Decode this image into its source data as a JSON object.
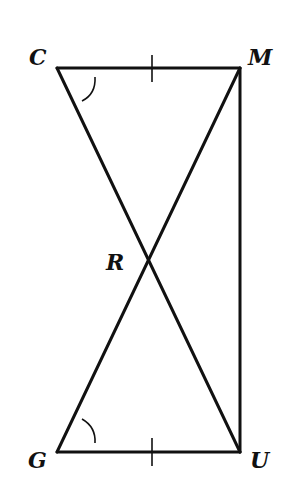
{
  "diagram": {
    "type": "geometry",
    "stroke_color": "#111111",
    "background": "#ffffff",
    "points": {
      "C": {
        "label": "C",
        "x": 57,
        "y": 68
      },
      "M": {
        "label": "M",
        "x": 240,
        "y": 68
      },
      "G": {
        "label": "G",
        "x": 57,
        "y": 452
      },
      "U": {
        "label": "U",
        "x": 240,
        "y": 452
      },
      "R": {
        "label": "R",
        "x": 151,
        "y": 260
      }
    },
    "segments": [
      "CM",
      "CU",
      "MG",
      "MU",
      "GU"
    ],
    "congruence_marks": {
      "CM": "single-tick",
      "GU": "single-tick"
    },
    "angle_marks": {
      "C": "single-arc (angle MCR)",
      "G": "single-arc (angle UGR)"
    }
  }
}
